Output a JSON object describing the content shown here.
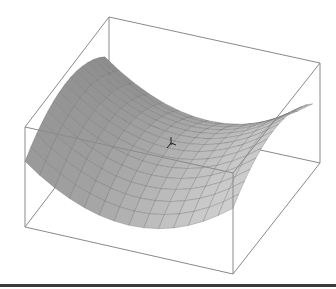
{
  "figure": {
    "kind": "3d-surface-plot",
    "surface": "saddle",
    "mesh_rows": 14,
    "mesh_cols": 14,
    "colors": {
      "background": "#ffffff",
      "box_edge": "#8a8a8a",
      "surface_light": "#d4d4d4",
      "surface_dark": "#7a7a7a",
      "mesh_line": "#555555",
      "bottom_bar": "#3a3a3a",
      "cursor": "#222222"
    },
    "box_corners_px": {
      "top_back_left": [
        109,
        17
      ],
      "top_back_right": [
        320,
        63
      ],
      "top_front_left": [
        25,
        127
      ],
      "top_front_right": [
        233,
        173
      ],
      "bottom_back_left": [
        109,
        117
      ],
      "bottom_back_right": [
        320,
        163
      ],
      "bottom_front_left": [
        25,
        227
      ],
      "bottom_front_right": [
        233,
        274
      ]
    }
  },
  "cursor": {
    "icon": "crosshair-cursor",
    "position_px": [
      171,
      143
    ]
  }
}
